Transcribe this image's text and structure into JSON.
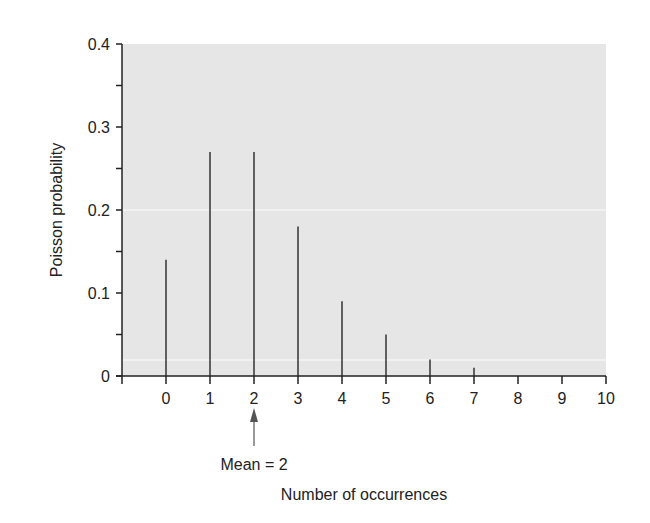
{
  "chart_data": {
    "type": "bar",
    "subtype": "stem",
    "title": "",
    "xlabel": "Number of occurrences",
    "ylabel": "Poisson probability",
    "categories": [
      "0",
      "1",
      "2",
      "3",
      "4",
      "5",
      "6",
      "7",
      "8",
      "9",
      "10"
    ],
    "x": [
      0,
      1,
      2,
      3,
      4,
      5,
      6,
      7,
      8,
      9,
      10
    ],
    "values": [
      0.14,
      0.27,
      0.27,
      0.18,
      0.09,
      0.05,
      0.02,
      0.01,
      0.0,
      0.0,
      0.0
    ],
    "xlim": [
      -1,
      10
    ],
    "ylim": [
      0,
      0.4
    ],
    "yticks": [
      0,
      0.1,
      0.2,
      0.3,
      0.4
    ],
    "ytick_labels": [
      "0",
      "0.1",
      "0.2",
      "0.3",
      "0.4"
    ],
    "yminor_step": 0.05,
    "xticks": [
      0,
      1,
      2,
      3,
      4,
      5,
      6,
      7,
      8,
      9,
      10
    ],
    "grid": false,
    "legend": null,
    "annotations": [
      {
        "text": "Mean = 2",
        "x": 2,
        "type": "arrow-up"
      }
    ],
    "colors": {
      "plot_bg": "#e6e6e6",
      "stem": "#333333",
      "axis": "#222222"
    }
  }
}
